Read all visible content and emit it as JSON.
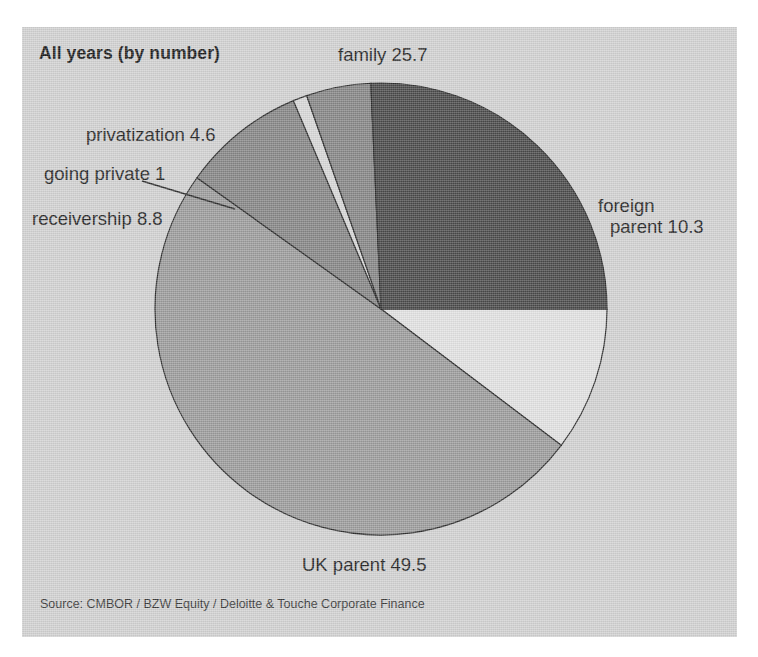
{
  "figure": {
    "title": "All years (by number)",
    "source": "Source: CMBOR / BZW Equity / Deloitte & Touche Corporate Finance",
    "panel_color": "#d2d2d2",
    "page_color": "#ffffff"
  },
  "labels": {
    "family": "family 25.7",
    "foreign_line1": "foreign",
    "foreign_line2": "parent 10.3",
    "privatization": "privatization 4.6",
    "going_private": "going private 1",
    "receivership": "receivership 8.8",
    "uk_parent": "UK parent 49.5"
  },
  "chart_data": {
    "type": "pie",
    "title": "All years (by number)",
    "subtitle": "",
    "xlabel": "",
    "ylabel": "",
    "units": "percent",
    "total": 99.9,
    "legend": "none (direct slice labels)",
    "grid": false,
    "start_angle_deg": 0,
    "direction": "clockwise",
    "annotations": [
      "going private 1 uses a leader line to its thin wedge"
    ],
    "categories": [
      "foreign parent",
      "UK parent",
      "receivership",
      "going private",
      "privatization",
      "family"
    ],
    "values": [
      10.3,
      49.5,
      8.8,
      1.0,
      4.6,
      25.7
    ],
    "labels": [
      "foreign parent 10.3",
      "UK parent 49.5",
      "receivership 8.8",
      "going private 1",
      "privatization 4.6",
      "family 25.7"
    ],
    "colors": [
      "#e2e2e2",
      "#9c9c9c",
      "#868686",
      "#d8d8d8",
      "#868686",
      "#4a4a4a"
    ],
    "slices": [
      {
        "name": "foreign parent",
        "value": 10.3,
        "color": "#e2e2e2",
        "start_deg": 0.0,
        "end_deg": 37.1
      },
      {
        "name": "UK parent",
        "value": 49.5,
        "color": "#9c9c9c",
        "start_deg": 37.1,
        "end_deg": 215.5
      },
      {
        "name": "receivership",
        "value": 8.8,
        "color": "#868686",
        "start_deg": 215.5,
        "end_deg": 247.2
      },
      {
        "name": "going private",
        "value": 1.0,
        "color": "#d8d8d8",
        "start_deg": 247.2,
        "end_deg": 250.8
      },
      {
        "name": "privatization",
        "value": 4.6,
        "color": "#868686",
        "start_deg": 250.8,
        "end_deg": 267.4
      },
      {
        "name": "family",
        "value": 25.7,
        "color": "#4a4a4a",
        "start_deg": 267.4,
        "end_deg": 360.0
      }
    ]
  }
}
